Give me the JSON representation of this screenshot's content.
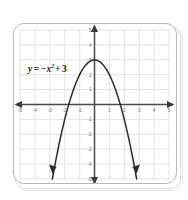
{
  "figure": {
    "name": "parabola-graph-card",
    "background_color": "#ffffff",
    "card_border_color": "#b9b9b9",
    "grid_color": "#d9d9d9",
    "axis_color": "#4a4a4a",
    "curve_color": "#2b2b2b",
    "label_color": "#6e6e6e"
  },
  "equation": {
    "variable_y": "y",
    "equals": "=",
    "minus": "−",
    "variable_x": "x",
    "exponent": "2",
    "plus": "+",
    "constant": "3",
    "full_text": "y = −x² + 3"
  },
  "axes": {
    "x_label_values": [
      "-5",
      "-4",
      "-3",
      "-2",
      "-1",
      "1",
      "2",
      "3",
      "4",
      "5"
    ],
    "y_label_values": [
      "5",
      "4",
      "3",
      "2",
      "1",
      "-1",
      "-2",
      "-3",
      "-4",
      "-5"
    ],
    "x_min": -5,
    "x_max": 5,
    "y_min": -5,
    "y_max": 5,
    "grid": "on",
    "x_arrowheads": "both",
    "y_arrowheads": "both"
  },
  "chart_data": {
    "type": "line",
    "title": "",
    "subtitle": "",
    "xlabel": "x",
    "ylabel": "y",
    "xlim": [
      -5,
      5
    ],
    "ylim": [
      -5,
      5
    ],
    "grid": true,
    "legend": "none",
    "annotations": [
      {
        "text": "y = −x² + 3",
        "x": -3.1,
        "y": 2.45
      }
    ],
    "series": [
      {
        "name": "y = -x^2 + 3",
        "equation": "y = -x^2 + 3",
        "vertex": [
          0,
          3
        ],
        "x_intercepts": [
          -1.732,
          1.732
        ],
        "y_intercept": 3,
        "opens": "down",
        "endpoint_arrows": true,
        "x": [
          -2.83,
          -2.6,
          -2.4,
          -2.2,
          -2.0,
          -1.8,
          -1.6,
          -1.4,
          -1.2,
          -1.0,
          -0.8,
          -0.6,
          -0.4,
          -0.2,
          0,
          0.2,
          0.4,
          0.6,
          0.8,
          1.0,
          1.2,
          1.4,
          1.6,
          1.8,
          2.0,
          2.2,
          2.4,
          2.6,
          2.83
        ],
        "values": [
          -5.0,
          -3.76,
          -2.76,
          -1.84,
          -1.0,
          -0.24,
          0.44,
          1.04,
          1.56,
          2.0,
          2.36,
          2.64,
          2.84,
          2.96,
          3.0,
          2.96,
          2.84,
          2.64,
          2.36,
          2.0,
          1.56,
          1.04,
          0.44,
          -0.24,
          -1.0,
          -1.84,
          -2.76,
          -3.76,
          -5.0
        ]
      }
    ]
  }
}
